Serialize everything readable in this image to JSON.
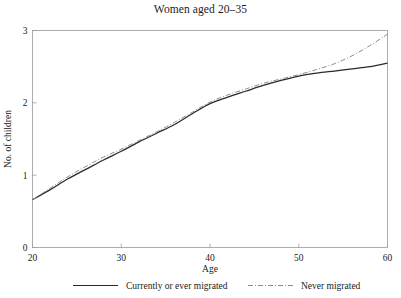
{
  "chart_data": {
    "type": "line",
    "title": "Women aged 20–35",
    "xlabel": "Age",
    "ylabel": "No. of children",
    "xlim": [
      20,
      60
    ],
    "ylim": [
      0,
      3
    ],
    "xticks": [
      20,
      30,
      40,
      50,
      60
    ],
    "xtick_labels": [
      "20",
      "30",
      "40",
      "50",
      "60"
    ],
    "yticks": [
      0,
      1,
      2,
      3
    ],
    "ytick_labels": [
      "0",
      "1",
      "2",
      "3"
    ],
    "grid": false,
    "legend_position": "below-axes",
    "series": [
      {
        "name": "Currently or ever migrated",
        "style": "solid",
        "color": "#2a2a2a",
        "x": [
          20,
          22,
          24,
          26,
          28,
          30,
          32,
          34,
          36,
          38,
          40,
          42,
          44,
          46,
          48,
          50,
          52,
          54,
          56,
          58,
          60
        ],
        "values": [
          0.66,
          0.8,
          0.95,
          1.08,
          1.21,
          1.33,
          1.46,
          1.58,
          1.7,
          1.85,
          1.99,
          2.08,
          2.16,
          2.24,
          2.31,
          2.37,
          2.41,
          2.44,
          2.47,
          2.5,
          2.55
        ]
      },
      {
        "name": "Never migrated",
        "style": "dash-dot",
        "color": "#8d8d8d",
        "x": [
          20,
          22,
          24,
          26,
          28,
          30,
          32,
          34,
          36,
          38,
          40,
          42,
          44,
          46,
          48,
          50,
          52,
          54,
          56,
          58,
          60
        ],
        "values": [
          0.66,
          0.82,
          0.98,
          1.12,
          1.25,
          1.36,
          1.48,
          1.6,
          1.73,
          1.87,
          2.01,
          2.11,
          2.19,
          2.27,
          2.33,
          2.39,
          2.46,
          2.54,
          2.65,
          2.79,
          2.95
        ]
      }
    ]
  },
  "legend": {
    "entries": [
      {
        "label": "Currently or ever migrated",
        "style": "solid"
      },
      {
        "label": "Never migrated",
        "style": "dash-dot"
      }
    ]
  },
  "colors": {
    "solid_series": "#2a2a2a",
    "dashdot_series": "#8d8d8d",
    "frame": "#9a9a9a",
    "background": "#ffffff"
  }
}
